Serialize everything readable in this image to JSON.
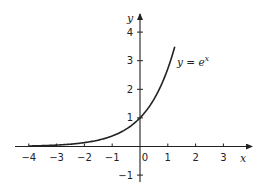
{
  "chart_data": {
    "type": "line",
    "title": "",
    "xlabel": "x",
    "ylabel": "y",
    "xlim": [
      -4.4,
      4.0
    ],
    "ylim": [
      -1.2,
      4.6
    ],
    "grid": false,
    "legend": "none",
    "x_ticks": [
      -4,
      -3,
      -2,
      -1,
      0,
      1,
      2,
      3
    ],
    "x_tick_labels": [
      "-4",
      "-3",
      "-2",
      "-1",
      "0",
      "1",
      "2",
      "3"
    ],
    "y_ticks": [
      -1,
      1,
      2,
      3,
      4
    ],
    "y_tick_labels": [
      "-1",
      "1",
      "2",
      "3",
      "4"
    ],
    "series": [
      {
        "name": "y = e^x",
        "function": "exp(x)",
        "x_range": [
          -4.0,
          1.25
        ],
        "x": [
          -4,
          -3,
          -2,
          -1,
          0,
          0.5,
          1,
          1.25
        ],
        "y": [
          0.018,
          0.05,
          0.135,
          0.368,
          1.0,
          1.649,
          2.718,
          3.49
        ]
      }
    ],
    "annotations": [
      {
        "text": "y = e",
        "superscript": "x",
        "x": 1.55,
        "y": 3.0
      }
    ]
  }
}
